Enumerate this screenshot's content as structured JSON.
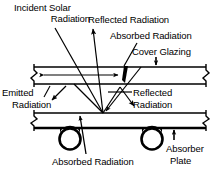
{
  "diagram": {
    "type": "schematic-cross-section",
    "colors": {
      "line": "#000000",
      "background": "#ffffff",
      "fill": "#000000"
    },
    "labels": {
      "incident_solar_line1": "Incident Solar",
      "incident_solar_line2": "Radiation",
      "reflected_top": "Reflected Radiation",
      "absorbed_top": "Absorbed Radiation",
      "cover_glazing": "Cover Glazing",
      "emitted_line1": "Emitted",
      "emitted_line2": "Radiation",
      "reflected_mid_line1": "Reflected",
      "reflected_mid_line2": "Radiation",
      "absorbed_bottom": "Absorbed Radiation",
      "absorber_plate_line1": "Absorber",
      "absorber_plate_line2": "Plate"
    },
    "components": [
      {
        "name": "cover-glazing",
        "label": "Cover Glazing",
        "description": "upper transparent glazing band"
      },
      {
        "name": "absorber-plate",
        "label": "Absorber Plate",
        "description": "lower plate with fluid tubes"
      },
      {
        "name": "fluid-tube-left",
        "label": "",
        "description": "circular fluid tube"
      },
      {
        "name": "fluid-tube-right",
        "label": "",
        "description": "circular fluid tube"
      }
    ],
    "rays": [
      {
        "name": "incident-solar-ray",
        "label": "Incident Solar Radiation"
      },
      {
        "name": "reflected-from-cover-ray",
        "label": "Reflected Radiation"
      },
      {
        "name": "absorbed-in-cover-ray",
        "label": "Absorbed Radiation"
      },
      {
        "name": "emitted-radiation-ray",
        "label": "Emitted Radiation"
      },
      {
        "name": "reflected-from-plate-ray",
        "label": "Reflected Radiation"
      },
      {
        "name": "absorbed-at-plate-ray",
        "label": "Absorbed Radiation"
      }
    ]
  }
}
